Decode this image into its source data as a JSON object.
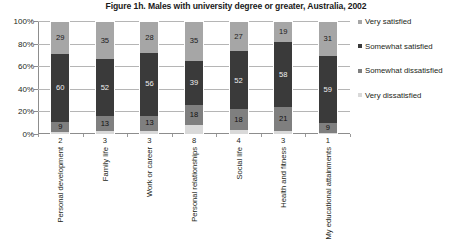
{
  "chart_data": {
    "type": "bar",
    "subtype": "stacked-column-100",
    "title": "Figure 1h. Males with university degree or greater, Australia, 2002",
    "xlabel": "",
    "ylabel": "",
    "ylim": [
      0,
      100
    ],
    "yticks": [
      "0%",
      "20%",
      "40%",
      "60%",
      "80%",
      "100%"
    ],
    "ytick_values": [
      0,
      20,
      40,
      60,
      80,
      100
    ],
    "grid": true,
    "legend_position": "right",
    "stack_order_top_to_bottom": [
      "Very satisfied",
      "Somewhat satisfied",
      "Somewhat dissatisfied",
      "Very dissatisfied"
    ],
    "categories": [
      "Personal development",
      "Family life",
      "Work or career",
      "Personal relationships",
      "Social life",
      "Health and fitness",
      "My educational attainments"
    ],
    "series": [
      {
        "name": "Very satisfied",
        "color": "#a6a6a6",
        "values": [
          29,
          35,
          28,
          35,
          27,
          19,
          31
        ]
      },
      {
        "name": "Somewhat satisfied",
        "color": "#3a3a3a",
        "values": [
          60,
          52,
          56,
          39,
          52,
          58,
          59
        ]
      },
      {
        "name": "Somewhat dissatisfied",
        "color": "#7f7f7f",
        "values": [
          9,
          13,
          13,
          18,
          18,
          21,
          9
        ]
      },
      {
        "name": "Very dissatisfied",
        "color": "#d9d9d9",
        "values": [
          2,
          3,
          3,
          8,
          4,
          3,
          1
        ]
      }
    ],
    "very_dissatisfied_labels_below_axis": [
      "2",
      "3",
      "3",
      "8",
      "4",
      "3",
      "1"
    ]
  },
  "legend": {
    "items": [
      {
        "label": "Very satisfied",
        "color": "#a6a6a6"
      },
      {
        "label": "Somewhat satisfied",
        "color": "#3a3a3a"
      },
      {
        "label": "Somewhat dissatisfied",
        "color": "#7f7f7f"
      },
      {
        "label": "Very dissatisfied",
        "color": "#d9d9d9"
      }
    ]
  }
}
